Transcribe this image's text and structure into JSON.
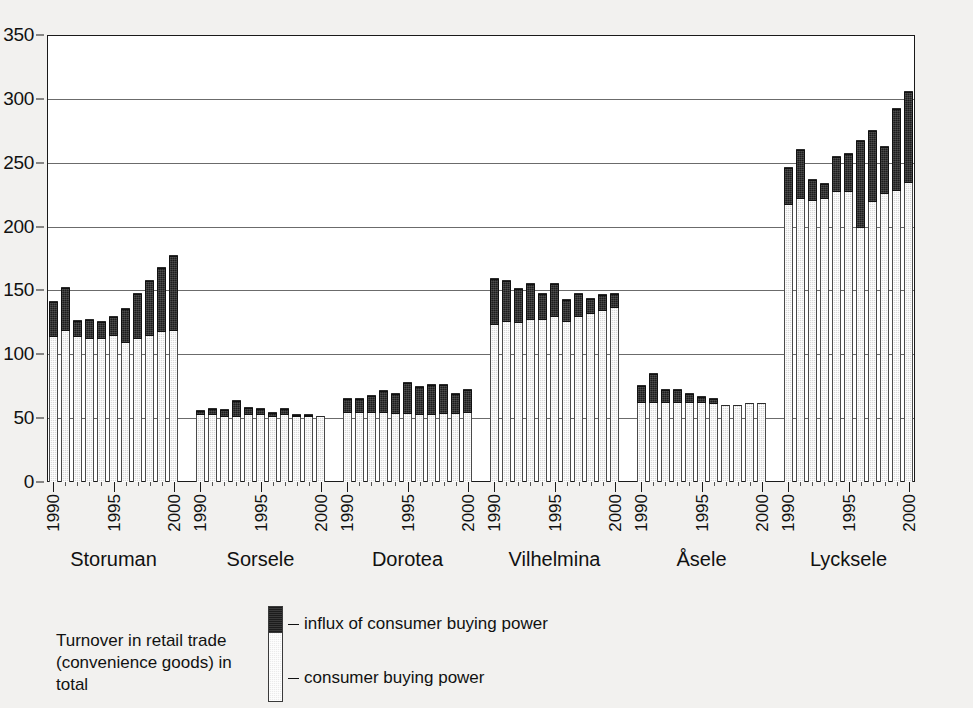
{
  "chart_data": {
    "type": "bar",
    "subtype": "stacked-bar-grouped",
    "title": "",
    "xlabel": "",
    "ylabel": "",
    "ylim": [
      0,
      350
    ],
    "ytick_values": [
      0,
      50,
      100,
      150,
      200,
      250,
      300,
      350
    ],
    "ytick_labels": [
      "0",
      "50",
      "100",
      "150",
      "200",
      "250",
      "300",
      "350"
    ],
    "grid": true,
    "legend_position": "bottom-center",
    "x": [
      1990,
      1991,
      1992,
      1993,
      1994,
      1995,
      1996,
      1997,
      1998,
      1999,
      2000
    ],
    "xtick_labels": [
      "1990",
      "1995",
      "2000"
    ],
    "xtick_years": [
      1990,
      1995,
      2000
    ],
    "series": [
      {
        "name": "consumer buying power",
        "color": "#d9d9d9",
        "legend_label": "consumer buying power"
      },
      {
        "name": "influx of consumer buying power",
        "color": "#1c1c1c",
        "legend_label": "influx of consumer buying power"
      }
    ],
    "caption": "Turnover in retail trade (convenience goods) in total",
    "caption_line1": "Turnover in retail trade",
    "caption_line2": "(convenience goods) in total",
    "groups": [
      {
        "name": "Storuman",
        "years": [
          1990,
          1991,
          1992,
          1993,
          1994,
          1995,
          1996,
          1997,
          1998,
          1999,
          2000
        ],
        "buying_power": [
          114,
          119,
          114,
          113,
          113,
          115,
          110,
          113,
          115,
          118,
          119
        ],
        "total": [
          142,
          153,
          127,
          128,
          126,
          130,
          136,
          148,
          158,
          168,
          178
        ]
      },
      {
        "name": "Sorsele",
        "years": [
          1990,
          1991,
          1992,
          1993,
          1994,
          1995,
          1996,
          1997,
          1998,
          1999,
          2000
        ],
        "buying_power": [
          53,
          53,
          52,
          52,
          53,
          53,
          52,
          53,
          52,
          52,
          52
        ],
        "total": [
          56,
          58,
          57,
          64,
          59,
          58,
          55,
          58,
          53,
          53,
          52
        ]
      },
      {
        "name": "Dorotea",
        "years": [
          1990,
          1991,
          1992,
          1993,
          1994,
          1995,
          1996,
          1997,
          1998,
          1999,
          2000
        ],
        "buying_power": [
          55,
          55,
          55,
          55,
          54,
          54,
          53,
          53,
          54,
          54,
          55
        ],
        "total": [
          66,
          66,
          68,
          72,
          70,
          78,
          75,
          77,
          77,
          70,
          73
        ]
      },
      {
        "name": "Vilhelmina",
        "years": [
          1990,
          1991,
          1992,
          1993,
          1994,
          1995,
          1996,
          1997,
          1998,
          1999,
          2000
        ],
        "buying_power": [
          124,
          126,
          125,
          128,
          128,
          130,
          126,
          130,
          132,
          135,
          137
        ],
        "total": [
          160,
          158,
          152,
          156,
          148,
          156,
          143,
          148,
          144,
          147,
          148
        ]
      },
      {
        "name": "Åsele",
        "years": [
          1990,
          1991,
          1992,
          1993,
          1994,
          1995,
          1996,
          1997,
          1998,
          1999,
          2000
        ],
        "buying_power": [
          63,
          63,
          63,
          63,
          63,
          63,
          62,
          60,
          60,
          62,
          62
        ],
        "total": [
          76,
          85,
          73,
          73,
          70,
          67,
          66,
          60,
          60,
          62,
          62
        ]
      },
      {
        "name": "Lycksele",
        "years": [
          1990,
          1991,
          1992,
          1993,
          1994,
          1995,
          1996,
          1997,
          1998,
          1999,
          2000
        ],
        "buying_power": [
          218,
          222,
          221,
          222,
          228,
          228,
          200,
          220,
          226,
          229,
          235
        ],
        "total": [
          247,
          261,
          237,
          234,
          255,
          258,
          268,
          276,
          263,
          293,
          306
        ]
      }
    ]
  }
}
